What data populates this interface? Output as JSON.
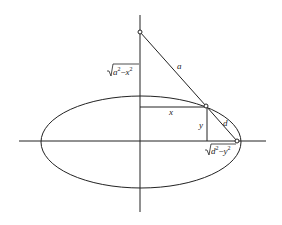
{
  "diagram": {
    "type": "geometry",
    "labels": {
      "a": "a",
      "x": "x",
      "y": "y",
      "d": "d",
      "vertical_segment": {
        "radical": "√",
        "base1": "a",
        "exp1": "2",
        "minus": "−",
        "base2": "x",
        "exp2": "2"
      },
      "horizontal_segment": {
        "radical": "√",
        "base1": "d",
        "exp1": "2",
        "minus": "−",
        "base2": "y",
        "exp2": "2"
      }
    },
    "colors": {
      "stroke": "#222222",
      "background": "#ffffff"
    }
  }
}
